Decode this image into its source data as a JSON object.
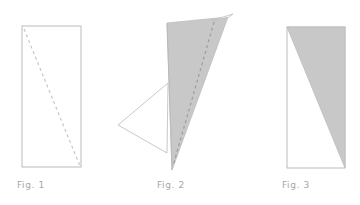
{
  "page": {
    "background_color": "#ffffff",
    "width": 360,
    "height": 205
  },
  "style": {
    "stroke_color": "#b4b4b4",
    "stroke_color_light": "#c6c6c6",
    "fill_gray": "#c8c8c8",
    "fill_white": "#ffffff",
    "caption_color": "#a6a6a6",
    "dash_pattern": "3 3",
    "stroke_width": 0.9
  },
  "figures": [
    {
      "id": "fig1",
      "caption": "Fig. 1",
      "caption_x": 17,
      "caption_y": 180,
      "shapes": {
        "rectangle": {
          "x": 22,
          "y": 26,
          "width": 59,
          "height": 141
        },
        "dashed_diagonal": {
          "x1": 24,
          "y1": 29,
          "x2": 80,
          "y2": 166
        }
      }
    },
    {
      "id": "fig2",
      "caption": "Fig. 2",
      "caption_x": 157,
      "caption_y": 180,
      "shapes": {
        "gray_triangle_points": "167,23 228,17 172,170",
        "white_sliver_points": "213,21 233,14 228,17",
        "white_flap_points": "168,83 118,125 167,153",
        "dashed_fold": {
          "x1": 214,
          "y1": 22,
          "x2": 173,
          "y2": 166
        },
        "fold_edge": {
          "x1": 167,
          "y1": 23,
          "x2": 172,
          "y2": 170
        }
      }
    },
    {
      "id": "fig3",
      "caption": "Fig. 3",
      "caption_x": 282,
      "caption_y": 180,
      "shapes": {
        "rectangle": {
          "x": 287,
          "y": 27,
          "width": 58,
          "height": 141
        },
        "gray_triangle_points": "287,27 345,27 345,168"
      }
    }
  ]
}
